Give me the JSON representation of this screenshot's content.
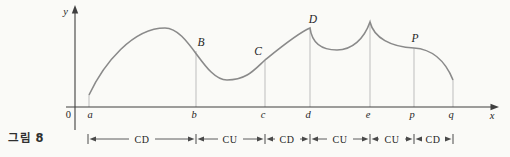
{
  "figure_label": "그림 8",
  "axes": {
    "x_label": "x",
    "y_label": "y",
    "origin_label": "0"
  },
  "axis_points": [
    {
      "label": "a"
    },
    {
      "label": "b"
    },
    {
      "label": "c"
    },
    {
      "label": "d"
    },
    {
      "label": "e"
    },
    {
      "label": "p"
    },
    {
      "label": "q"
    }
  ],
  "curve_points": [
    {
      "label": "B"
    },
    {
      "label": "C"
    },
    {
      "label": "D"
    },
    {
      "label": "P"
    }
  ],
  "intervals": [
    {
      "from": "a",
      "to": "b",
      "label": "CD"
    },
    {
      "from": "b",
      "to": "c",
      "label": "CU"
    },
    {
      "from": "c",
      "to": "d",
      "label": "CD"
    },
    {
      "from": "d",
      "to": "e",
      "label": "CU"
    },
    {
      "from": "e",
      "to": "p",
      "label": "CU"
    },
    {
      "from": "p",
      "to": "q",
      "label": "CD"
    }
  ],
  "colors": {
    "background": "#fafaf7",
    "curve": "#8a8a8a",
    "axis": "#3f3f3f",
    "guide_line": "#bdbdbd",
    "text": "#262626"
  }
}
